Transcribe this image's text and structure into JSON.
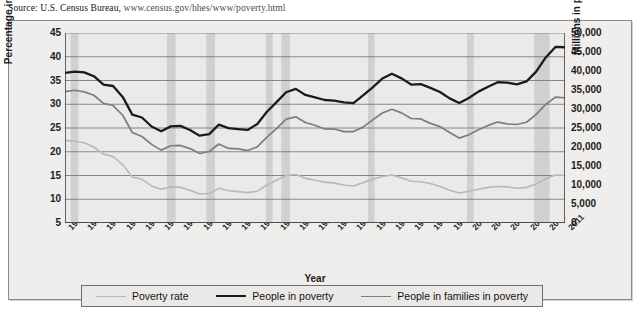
{
  "source": {
    "label": "Source: U.S. Census Bureau,",
    "url": "www.census.gov/hhes/www/poverty.html"
  },
  "legend": {
    "items": [
      {
        "label": "Poverty rate",
        "color": "#b9b9b9",
        "width": 1.6
      },
      {
        "label": "People in poverty",
        "color": "#1b1b1b",
        "width": 2.4
      },
      {
        "label": "People in families in poverty",
        "color": "#7d7d7d",
        "width": 1.8
      }
    ]
  },
  "chart_data": {
    "type": "line",
    "title": "",
    "xlabel": "Year",
    "ylabel": "Percentage in poverty",
    "y2label": "Millions in poverty",
    "grid": true,
    "legend_position": "bottom",
    "xlim": [
      1959,
      2011
    ],
    "ylim": [
      5,
      45
    ],
    "y2lim": [
      0,
      50000
    ],
    "yticks": [
      5,
      10,
      15,
      20,
      25,
      30,
      35,
      40,
      45
    ],
    "y2ticks": [
      0,
      5000,
      10000,
      15000,
      20000,
      25000,
      30000,
      35000,
      40000,
      45000,
      50000
    ],
    "x": [
      1959,
      1960,
      1961,
      1962,
      1963,
      1964,
      1965,
      1966,
      1967,
      1968,
      1969,
      1970,
      1971,
      1972,
      1973,
      1974,
      1975,
      1976,
      1977,
      1978,
      1979,
      1980,
      1981,
      1982,
      1983,
      1984,
      1985,
      1986,
      1987,
      1988,
      1989,
      1990,
      1991,
      1992,
      1993,
      1994,
      1995,
      1996,
      1997,
      1998,
      1999,
      2000,
      2001,
      2002,
      2003,
      2004,
      2005,
      2006,
      2007,
      2008,
      2009,
      2010,
      2011
    ],
    "xticks": [
      1959,
      1961,
      1963,
      1965,
      1967,
      1969,
      1971,
      1973,
      1975,
      1977,
      1979,
      1981,
      1983,
      1985,
      1987,
      1989,
      1991,
      1993,
      1995,
      1997,
      1999,
      2001,
      2003,
      2005,
      2007,
      2009,
      2011
    ],
    "series": [
      {
        "name": "People in poverty",
        "axis": "right",
        "units": "thousands",
        "color": "#1b1b1b",
        "values": [
          39490,
          39851,
          39628,
          38625,
          36436,
          36055,
          33185,
          28510,
          27769,
          25389,
          24147,
          25420,
          25559,
          24460,
          22973,
          23370,
          25877,
          24975,
          24720,
          24497,
          26072,
          29272,
          31822,
          34398,
          35303,
          33700,
          33064,
          32370,
          32221,
          31745,
          31528,
          33585,
          35708,
          38014,
          39265,
          38059,
          36425,
          36529,
          35574,
          34476,
          32791,
          31581,
          32907,
          34570,
          35861,
          37040,
          36950,
          36460,
          37276,
          39829,
          43569,
          46343,
          46247
        ]
      },
      {
        "name": "People in families in poverty",
        "axis": "right",
        "units": "thousands",
        "color": "#7d7d7d",
        "values": [
          34562,
          34925,
          34509,
          33623,
          31498,
          30912,
          28358,
          23809,
          22771,
          20695,
          19175,
          20330,
          20405,
          19577,
          18299,
          18817,
          20789,
          19632,
          19505,
          19062,
          20033,
          22601,
          24850,
          27349,
          27933,
          26458,
          25729,
          24754,
          24725,
          24048,
          24066,
          25232,
          27143,
          28961,
          29927,
          28985,
          27501,
          27376,
          26217,
          25370,
          23830,
          22347,
          23215,
          24534,
          25684,
          26564,
          26068,
          25915,
          26509,
          28564,
          31197,
          33122,
          32960
        ]
      },
      {
        "name": "Poverty rate",
        "axis": "left",
        "units": "percent",
        "color": "#b9b9b9",
        "values": [
          22.4,
          22.2,
          21.9,
          21.0,
          19.5,
          19.0,
          17.3,
          14.7,
          14.2,
          12.8,
          12.1,
          12.6,
          12.5,
          11.9,
          11.1,
          11.2,
          12.3,
          11.8,
          11.6,
          11.4,
          11.7,
          13.0,
          14.0,
          15.0,
          15.2,
          14.4,
          14.0,
          13.6,
          13.4,
          13.0,
          12.8,
          13.5,
          14.2,
          14.8,
          15.1,
          14.5,
          13.8,
          13.7,
          13.3,
          12.7,
          11.9,
          11.3,
          11.7,
          12.1,
          12.5,
          12.7,
          12.6,
          12.3,
          12.5,
          13.2,
          14.3,
          15.1,
          15.0
        ]
      }
    ],
    "recession_bands": [
      {
        "start": 1959.6,
        "end": 1960.4
      },
      {
        "start": 1969.6,
        "end": 1970.5
      },
      {
        "start": 1973.7,
        "end": 1974.6
      },
      {
        "start": 1979.9,
        "end": 1980.6
      },
      {
        "start": 1981.5,
        "end": 1982.4
      },
      {
        "start": 1990.5,
        "end": 1991.2
      },
      {
        "start": 2000.8,
        "end": 2001.5
      },
      {
        "start": 2007.8,
        "end": 2009.4
      }
    ],
    "recession_band_color": "#c9c7c5"
  }
}
